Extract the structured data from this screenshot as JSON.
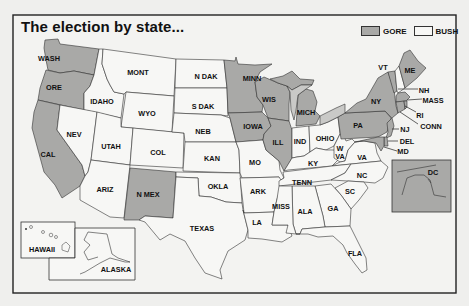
{
  "title": "The election by state...",
  "legend": [
    {
      "label": "GORE",
      "color": "#a9a9a7"
    },
    {
      "label": "BUSH",
      "color": "#f7f7f5"
    }
  ],
  "colors": {
    "gore": "#a9a9a7",
    "bush": "#f7f7f5",
    "lake": "#c9c9c7",
    "border": "#333333",
    "background": "#efefed"
  },
  "states": [
    {
      "id": "wash",
      "label": "WASH",
      "winner": "gore",
      "x": 49,
      "y": 58
    },
    {
      "id": "ore",
      "label": "ORE",
      "winner": "gore",
      "x": 54,
      "y": 87
    },
    {
      "id": "cal",
      "label": "CAL",
      "winner": "gore",
      "x": 48,
      "y": 154
    },
    {
      "id": "idaho",
      "label": "IDAHO",
      "winner": "bush",
      "x": 102,
      "y": 101
    },
    {
      "id": "nev",
      "label": "NEV",
      "winner": "bush",
      "x": 74,
      "y": 134
    },
    {
      "id": "mont",
      "label": "MONT",
      "winner": "bush",
      "x": 138,
      "y": 72
    },
    {
      "id": "wyo",
      "label": "WYO",
      "winner": "bush",
      "x": 147,
      "y": 113
    },
    {
      "id": "utah",
      "label": "UTAH",
      "winner": "bush",
      "x": 111,
      "y": 146
    },
    {
      "id": "col",
      "label": "COL",
      "winner": "bush",
      "x": 158,
      "y": 152
    },
    {
      "id": "ariz",
      "label": "ARIZ",
      "winner": "bush",
      "x": 105,
      "y": 189
    },
    {
      "id": "nmex",
      "label": "N MEX",
      "winner": "gore",
      "x": 148,
      "y": 194
    },
    {
      "id": "ndak",
      "label": "N DAK",
      "winner": "bush",
      "x": 206,
      "y": 76
    },
    {
      "id": "sdak",
      "label": "S DAK",
      "winner": "bush",
      "x": 203,
      "y": 106
    },
    {
      "id": "neb",
      "label": "NEB",
      "winner": "bush",
      "x": 203,
      "y": 131
    },
    {
      "id": "kan",
      "label": "KAN",
      "winner": "bush",
      "x": 212,
      "y": 158
    },
    {
      "id": "okla",
      "label": "OKLA",
      "winner": "bush",
      "x": 218,
      "y": 186
    },
    {
      "id": "texas",
      "label": "TEXAS",
      "winner": "bush",
      "x": 202,
      "y": 228
    },
    {
      "id": "minn",
      "label": "MINN",
      "winner": "gore",
      "x": 252,
      "y": 78
    },
    {
      "id": "iowa",
      "label": "IOWA",
      "winner": "gore",
      "x": 253,
      "y": 126
    },
    {
      "id": "mo",
      "label": "MO",
      "winner": "bush",
      "x": 255,
      "y": 162
    },
    {
      "id": "ark",
      "label": "ARK",
      "winner": "bush",
      "x": 258,
      "y": 191
    },
    {
      "id": "la",
      "label": "LA",
      "winner": "bush",
      "x": 257,
      "y": 222
    },
    {
      "id": "wis",
      "label": "WIS",
      "winner": "gore",
      "x": 269,
      "y": 99
    },
    {
      "id": "ill",
      "label": "ILL",
      "winner": "gore",
      "x": 278,
      "y": 142
    },
    {
      "id": "mich",
      "label": "MICH",
      "winner": "gore",
      "x": 306,
      "y": 112
    },
    {
      "id": "ind",
      "label": "IND",
      "winner": "bush",
      "x": 300,
      "y": 141
    },
    {
      "id": "ohio",
      "label": "OHIO",
      "winner": "bush",
      "x": 325,
      "y": 138
    },
    {
      "id": "ky",
      "label": "KY",
      "winner": "bush",
      "x": 313,
      "y": 163
    },
    {
      "id": "tenn",
      "label": "TENN",
      "winner": "bush",
      "x": 302,
      "y": 182
    },
    {
      "id": "miss",
      "label": "MISS",
      "winner": "bush",
      "x": 281,
      "y": 206
    },
    {
      "id": "ala",
      "label": "ALA",
      "winner": "bush",
      "x": 305,
      "y": 211
    },
    {
      "id": "ga",
      "label": "GA",
      "winner": "bush",
      "x": 333,
      "y": 208
    },
    {
      "id": "fla",
      "label": "FLA",
      "winner": "bush",
      "x": 355,
      "y": 253
    },
    {
      "id": "sc",
      "label": "SC",
      "winner": "bush",
      "x": 350,
      "y": 191
    },
    {
      "id": "nc",
      "label": "NC",
      "winner": "bush",
      "x": 362,
      "y": 175
    },
    {
      "id": "va",
      "label": "VA",
      "winner": "bush",
      "x": 362,
      "y": 157
    },
    {
      "id": "wva",
      "label": "W\nVA",
      "winner": "bush",
      "x": 340,
      "y": 153
    },
    {
      "id": "pa",
      "label": "PA",
      "winner": "gore",
      "x": 358,
      "y": 125
    },
    {
      "id": "ny",
      "label": "NY",
      "winner": "gore",
      "x": 376,
      "y": 101
    },
    {
      "id": "vt",
      "label": "VT",
      "winner": "gore",
      "x": 383,
      "y": 67
    },
    {
      "id": "me",
      "label": "ME",
      "winner": "gore",
      "x": 410,
      "y": 70
    },
    {
      "id": "nh",
      "label": "NH",
      "winner": "bush",
      "x": 424,
      "y": 90
    },
    {
      "id": "mass",
      "label": "MASS",
      "winner": "gore",
      "x": 433,
      "y": 100
    },
    {
      "id": "ri",
      "label": "RI",
      "winner": "gore",
      "x": 420,
      "y": 115
    },
    {
      "id": "conn",
      "label": "CONN",
      "winner": "gore",
      "x": 431,
      "y": 126
    },
    {
      "id": "nj",
      "label": "NJ",
      "winner": "gore",
      "x": 405,
      "y": 129
    },
    {
      "id": "del",
      "label": "DEL",
      "winner": "gore",
      "x": 407,
      "y": 141
    },
    {
      "id": "md",
      "label": "MD",
      "winner": "gore",
      "x": 403,
      "y": 151
    },
    {
      "id": "dc",
      "label": "DC",
      "winner": "gore",
      "x": 433,
      "y": 172
    },
    {
      "id": "hawaii",
      "label": "HAWAII",
      "winner": "gore",
      "x": 42,
      "y": 249
    },
    {
      "id": "alaska",
      "label": "ALASKA",
      "winner": "bush",
      "x": 116,
      "y": 269
    }
  ]
}
